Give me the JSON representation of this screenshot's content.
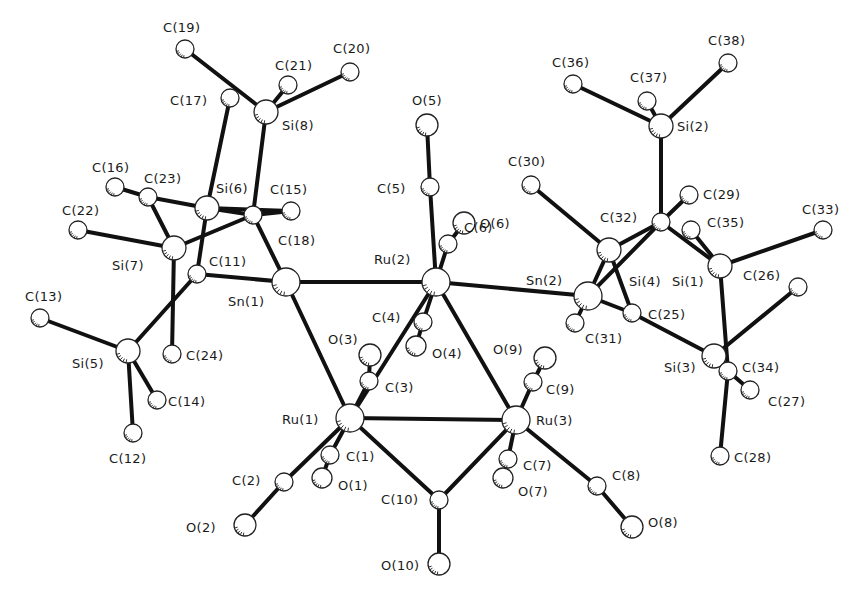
{
  "figure": {
    "type": "ORTEP molecular structure",
    "background": "#ffffff",
    "ink": "#111111"
  },
  "atoms": [
    {
      "id": "Ru1",
      "label": "Ru(1)",
      "x": 350,
      "y": 418,
      "r": 14,
      "lx": 282,
      "ly": 424
    },
    {
      "id": "Ru2",
      "label": "Ru(2)",
      "x": 436,
      "y": 282,
      "r": 14,
      "lx": 374,
      "ly": 264
    },
    {
      "id": "Ru3",
      "label": "Ru(3)",
      "x": 516,
      "y": 420,
      "r": 14,
      "lx": 536,
      "ly": 425
    },
    {
      "id": "Sn1",
      "label": "Sn(1)",
      "x": 286,
      "y": 282,
      "r": 14,
      "lx": 228,
      "ly": 306
    },
    {
      "id": "Sn2",
      "label": "Sn(2)",
      "x": 588,
      "y": 296,
      "r": 14,
      "lx": 526,
      "ly": 285
    },
    {
      "id": "Si1",
      "label": "Si(1)",
      "x": 720,
      "y": 266,
      "r": 12,
      "lx": 672,
      "ly": 286
    },
    {
      "id": "Si2",
      "label": "Si(2)",
      "x": 661,
      "y": 126,
      "r": 12,
      "lx": 677,
      "ly": 131
    },
    {
      "id": "Si3",
      "label": "Si(3)",
      "x": 714,
      "y": 356,
      "r": 12,
      "lx": 664,
      "ly": 372
    },
    {
      "id": "Si4",
      "label": "Si(4)",
      "x": 609,
      "y": 250,
      "r": 12,
      "lx": 629,
      "ly": 286
    },
    {
      "id": "Si5",
      "label": "Si(5)",
      "x": 128,
      "y": 351,
      "r": 12,
      "lx": 72,
      "ly": 368
    },
    {
      "id": "Si6",
      "label": "Si(6)",
      "x": 207,
      "y": 208,
      "r": 12,
      "lx": 216,
      "ly": 193
    },
    {
      "id": "Si7",
      "label": "Si(7)",
      "x": 174,
      "y": 248,
      "r": 12,
      "lx": 112,
      "ly": 270
    },
    {
      "id": "Si8",
      "label": "Si(8)",
      "x": 266,
      "y": 112,
      "r": 12,
      "lx": 282,
      "ly": 130
    },
    {
      "id": "C1",
      "label": "C(1)",
      "x": 330,
      "y": 455,
      "r": 9,
      "lx": 346,
      "ly": 461
    },
    {
      "id": "C2",
      "label": "C(2)",
      "x": 284,
      "y": 482,
      "r": 9,
      "lx": 232,
      "ly": 485
    },
    {
      "id": "C3",
      "label": "C(3)",
      "x": 369,
      "y": 381,
      "r": 9,
      "lx": 385,
      "ly": 392
    },
    {
      "id": "C4",
      "label": "C(4)",
      "x": 423,
      "y": 322,
      "r": 9,
      "lx": 372,
      "ly": 322
    },
    {
      "id": "C5",
      "label": "C(5)",
      "x": 430,
      "y": 187,
      "r": 9,
      "lx": 377,
      "ly": 193
    },
    {
      "id": "C6",
      "label": "C(6)",
      "x": 448,
      "y": 244,
      "r": 9,
      "lx": 464,
      "ly": 232
    },
    {
      "id": "C7",
      "label": "C(7)",
      "x": 508,
      "y": 459,
      "r": 9,
      "lx": 523,
      "ly": 470
    },
    {
      "id": "C8",
      "label": "C(8)",
      "x": 597,
      "y": 486,
      "r": 9,
      "lx": 612,
      "ly": 480
    },
    {
      "id": "C9",
      "label": "C(9)",
      "x": 533,
      "y": 382,
      "r": 9,
      "lx": 546,
      "ly": 394
    },
    {
      "id": "C10",
      "label": "C(10)",
      "x": 439,
      "y": 500,
      "r": 9,
      "lx": 381,
      "ly": 504
    },
    {
      "id": "C11",
      "label": "C(11)",
      "x": 197,
      "y": 274,
      "r": 9,
      "lx": 209,
      "ly": 266
    },
    {
      "id": "C12",
      "label": "C(12)",
      "x": 133,
      "y": 433,
      "r": 9,
      "lx": 109,
      "ly": 463
    },
    {
      "id": "C13",
      "label": "C(13)",
      "x": 40,
      "y": 318,
      "r": 9,
      "lx": 25,
      "ly": 301
    },
    {
      "id": "C14",
      "label": "C(14)",
      "x": 157,
      "y": 400,
      "r": 9,
      "lx": 168,
      "ly": 406
    },
    {
      "id": "C15",
      "label": "C(15)",
      "x": 291,
      "y": 211,
      "r": 9,
      "lx": 270,
      "ly": 194
    },
    {
      "id": "C16",
      "label": "C(16)",
      "x": 115,
      "y": 187,
      "r": 9,
      "lx": 92,
      "ly": 172
    },
    {
      "id": "C17",
      "label": "C(17)",
      "x": 230,
      "y": 98,
      "r": 9,
      "lx": 170,
      "ly": 105
    },
    {
      "id": "C18",
      "label": "C(18)",
      "x": 253,
      "y": 215,
      "r": 9,
      "lx": 278,
      "ly": 245
    },
    {
      "id": "C19",
      "label": "C(19)",
      "x": 185,
      "y": 49,
      "r": 9,
      "lx": 163,
      "ly": 32
    },
    {
      "id": "C20",
      "label": "C(20)",
      "x": 350,
      "y": 72,
      "r": 9,
      "lx": 333,
      "ly": 53
    },
    {
      "id": "C21",
      "label": "C(21)",
      "x": 288,
      "y": 85,
      "r": 9,
      "lx": 275,
      "ly": 70
    },
    {
      "id": "C22",
      "label": "C(22)",
      "x": 78,
      "y": 230,
      "r": 9,
      "lx": 62,
      "ly": 215
    },
    {
      "id": "C23",
      "label": "C(23)",
      "x": 148,
      "y": 197,
      "r": 9,
      "lx": 144,
      "ly": 183
    },
    {
      "id": "C24",
      "label": "C(24)",
      "x": 172,
      "y": 354,
      "r": 9,
      "lx": 186,
      "ly": 360
    },
    {
      "id": "C25",
      "label": "C(25)",
      "x": 632,
      "y": 313,
      "r": 9,
      "lx": 648,
      "ly": 319
    },
    {
      "id": "C26",
      "label": "C(26)",
      "x": 720,
      "y": 266,
      "r": 0,
      "lx": 743,
      "ly": 280
    },
    {
      "id": "C27",
      "label": "C(27)",
      "x": 750,
      "y": 390,
      "r": 9,
      "lx": 768,
      "ly": 406
    },
    {
      "id": "C28",
      "label": "C(28)",
      "x": 720,
      "y": 456,
      "r": 9,
      "lx": 734,
      "ly": 462
    },
    {
      "id": "C29",
      "label": "C(29)",
      "x": 689,
      "y": 195,
      "r": 9,
      "lx": 703,
      "ly": 199
    },
    {
      "id": "C30",
      "label": "C(30)",
      "x": 531,
      "y": 185,
      "r": 9,
      "lx": 508,
      "ly": 166
    },
    {
      "id": "C31",
      "label": "C(31)",
      "x": 575,
      "y": 323,
      "r": 9,
      "lx": 585,
      "ly": 343
    },
    {
      "id": "C32",
      "label": "C(32)",
      "x": 661,
      "y": 222,
      "r": 9,
      "lx": 600,
      "ly": 222
    },
    {
      "id": "C33",
      "label": "C(33)",
      "x": 823,
      "y": 230,
      "r": 9,
      "lx": 802,
      "ly": 214
    },
    {
      "id": "C34",
      "label": "C(34)",
      "x": 728,
      "y": 371,
      "r": 9,
      "lx": 742,
      "ly": 372
    },
    {
      "id": "C35",
      "label": "C(35)",
      "x": 691,
      "y": 230,
      "r": 9,
      "lx": 707,
      "ly": 227
    },
    {
      "id": "C36",
      "label": "C(36)",
      "x": 573,
      "y": 84,
      "r": 9,
      "lx": 552,
      "ly": 67
    },
    {
      "id": "C37",
      "label": "C(37)",
      "x": 647,
      "y": 101,
      "r": 9,
      "lx": 630,
      "ly": 82
    },
    {
      "id": "C38",
      "label": "C(38)",
      "x": 728,
      "y": 63,
      "r": 9,
      "lx": 708,
      "ly": 45
    },
    {
      "id": "Cx",
      "label": "",
      "x": 798,
      "y": 287,
      "r": 9,
      "lx": 0,
      "ly": 0
    },
    {
      "id": "O1",
      "label": "O(1)",
      "x": 322,
      "y": 478,
      "r": 10,
      "lx": 338,
      "ly": 490
    },
    {
      "id": "O2",
      "label": "O(2)",
      "x": 245,
      "y": 525,
      "r": 11,
      "lx": 186,
      "ly": 532
    },
    {
      "id": "O3",
      "label": "O(3)",
      "x": 370,
      "y": 355,
      "r": 11,
      "lx": 328,
      "ly": 344
    },
    {
      "id": "O4",
      "label": "O(4)",
      "x": 416,
      "y": 346,
      "r": 10,
      "lx": 432,
      "ly": 358
    },
    {
      "id": "O5",
      "label": "O(5)",
      "x": 427,
      "y": 125,
      "r": 11,
      "lx": 412,
      "ly": 105
    },
    {
      "id": "O6",
      "label": "O(6)",
      "x": 464,
      "y": 223,
      "r": 11,
      "lx": 480,
      "ly": 228
    },
    {
      "id": "O7",
      "label": "O(7)",
      "x": 503,
      "y": 478,
      "r": 10,
      "lx": 518,
      "ly": 496
    },
    {
      "id": "O8",
      "label": "O(8)",
      "x": 632,
      "y": 527,
      "r": 11,
      "lx": 648,
      "ly": 527
    },
    {
      "id": "O9",
      "label": "O(9)",
      "x": 545,
      "y": 358,
      "r": 11,
      "lx": 493,
      "ly": 354
    },
    {
      "id": "O10",
      "label": "O(10)",
      "x": 439,
      "y": 564,
      "r": 11,
      "lx": 381,
      "ly": 570
    }
  ],
  "bonds": [
    [
      "Ru1",
      "Ru2"
    ],
    [
      "Ru1",
      "Ru3"
    ],
    [
      "Ru2",
      "Ru3"
    ],
    [
      "Ru2",
      "Sn1"
    ],
    [
      "Ru2",
      "Sn2"
    ],
    [
      "Ru1",
      "Sn1"
    ],
    [
      "Ru1",
      "C1"
    ],
    [
      "C1",
      "O1"
    ],
    [
      "Ru1",
      "C2"
    ],
    [
      "C2",
      "O2"
    ],
    [
      "Ru1",
      "C3"
    ],
    [
      "C3",
      "O3"
    ],
    [
      "Ru1",
      "C10"
    ],
    [
      "Ru3",
      "C10"
    ],
    [
      "C10",
      "O10"
    ],
    [
      "Ru2",
      "C4"
    ],
    [
      "C4",
      "O4"
    ],
    [
      "Ru2",
      "C5"
    ],
    [
      "C5",
      "O5"
    ],
    [
      "Ru2",
      "C6"
    ],
    [
      "C6",
      "O6"
    ],
    [
      "Ru3",
      "C7"
    ],
    [
      "C7",
      "O7"
    ],
    [
      "Ru3",
      "C8"
    ],
    [
      "C8",
      "O8"
    ],
    [
      "Ru3",
      "C9"
    ],
    [
      "C9",
      "O9"
    ],
    [
      "Sn1",
      "C11"
    ],
    [
      "Sn1",
      "C18"
    ],
    [
      "C11",
      "Si5"
    ],
    [
      "C11",
      "Si6"
    ],
    [
      "Si5",
      "C12"
    ],
    [
      "Si5",
      "C13"
    ],
    [
      "Si5",
      "C14"
    ],
    [
      "Si6",
      "C17"
    ],
    [
      "Si6",
      "C15"
    ],
    [
      "Si6",
      "C18"
    ],
    [
      "Si6",
      "C23"
    ],
    [
      "C18",
      "Si8"
    ],
    [
      "C18",
      "Si7"
    ],
    [
      "C18",
      "C15"
    ],
    [
      "Si8",
      "C19"
    ],
    [
      "Si8",
      "C20"
    ],
    [
      "Si8",
      "C21"
    ],
    [
      "Si7",
      "C22"
    ],
    [
      "Si7",
      "C23"
    ],
    [
      "Si7",
      "C24"
    ],
    [
      "C23",
      "C16"
    ],
    [
      "Sn2",
      "C31"
    ],
    [
      "Sn2",
      "C25"
    ],
    [
      "Sn2",
      "C32"
    ],
    [
      "Si4",
      "C30"
    ],
    [
      "Si4",
      "C32"
    ],
    [
      "Si4",
      "C25"
    ],
    [
      "Si4",
      "Sn2"
    ],
    [
      "C32",
      "Si2"
    ],
    [
      "C32",
      "C29"
    ],
    [
      "C32",
      "Si1"
    ],
    [
      "Si2",
      "C36"
    ],
    [
      "Si2",
      "C37"
    ],
    [
      "Si2",
      "C38"
    ],
    [
      "Si1",
      "C33"
    ],
    [
      "Si1",
      "C35"
    ],
    [
      "Si1",
      "C34"
    ],
    [
      "C25",
      "Si3"
    ],
    [
      "Si3",
      "Cx"
    ],
    [
      "Si3",
      "C34"
    ],
    [
      "C34",
      "C27"
    ],
    [
      "C34",
      "C28"
    ]
  ]
}
